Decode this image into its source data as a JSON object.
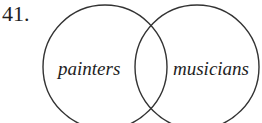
{
  "problem_number": "41.",
  "diagram": {
    "type": "venn",
    "sets": [
      {
        "label": "painters"
      },
      {
        "label": "musicians"
      }
    ],
    "stroke_color": "#333333"
  }
}
